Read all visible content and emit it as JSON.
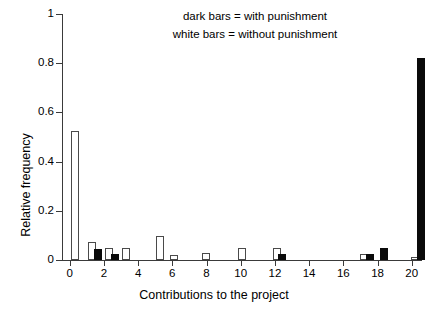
{
  "chart_data": {
    "type": "bar",
    "title": "",
    "xlabel": "Contributions to the project",
    "ylabel": "Relative frequency",
    "xlim": [
      -0.45,
      20.6
    ],
    "ylim": [
      0,
      1
    ],
    "grid": false,
    "xticks": [
      0,
      2,
      4,
      6,
      8,
      10,
      12,
      14,
      16,
      18,
      20
    ],
    "xtick_labels": [
      "0",
      "2",
      "4",
      "6",
      "8",
      "10",
      "12",
      "14",
      "16",
      "18",
      "20"
    ],
    "yticks": [
      0,
      0.2,
      0.4,
      0.6,
      0.8,
      1
    ],
    "ytick_labels": [
      "0",
      "0.2",
      "0.4",
      "0.6",
      "0.8",
      "1"
    ],
    "legend_position": "top-center-inside",
    "series": [
      {
        "name": "without punishment",
        "style": "white bars",
        "color": "#ffffff",
        "edge_color": "#4a4a4a",
        "x": [
          0,
          1,
          2,
          3,
          5,
          5.8,
          7.7,
          9.8,
          11.8,
          16.9,
          19.9
        ],
        "values": [
          0.525,
          0.075,
          0.047,
          0.047,
          0.098,
          0.021,
          0.028,
          0.047,
          0.047,
          0.024,
          0.012
        ]
      },
      {
        "name": "with punishment",
        "style": "dark bars",
        "color": "#0a0a0a",
        "edge_color": "#0a0a0a",
        "x": [
          1.35,
          2.35,
          12.15,
          17.25,
          18.1,
          20.25
        ],
        "values": [
          0.046,
          0.026,
          0.025,
          0.025,
          0.047,
          0.822
        ]
      }
    ],
    "annotations": [
      "dark bars = with punishment",
      "white bars = without punishment"
    ]
  },
  "legend": {
    "line1": "dark bars = with punishment",
    "line2": "white bars = without punishment"
  },
  "axes": {
    "x_title": "Contributions to the project",
    "y_title": "Relative frequency"
  }
}
